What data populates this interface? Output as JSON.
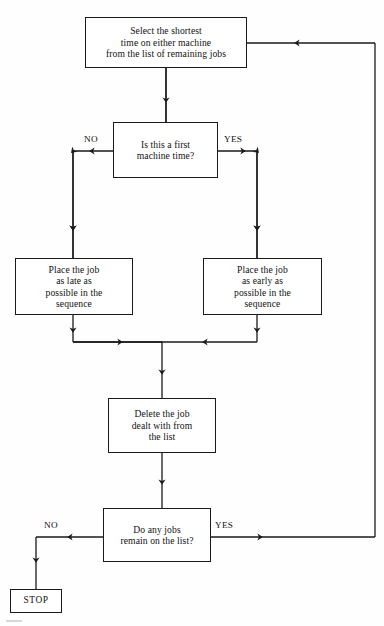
{
  "diagram": {
    "colors": {
      "line": "#1a1a1a",
      "text": "#111111",
      "background": "#fefefe"
    },
    "nodes": {
      "start": {
        "shape": "rectangle",
        "text": "Select the shortest\ntime on either machine\nfrom the list of remaining jobs"
      },
      "first_machine": {
        "shape": "rectangle",
        "text": "Is this a first\nmachine time?"
      },
      "place_late": {
        "shape": "rectangle",
        "text": "Place the job\nas late as\npossible in the\nsequence"
      },
      "place_early": {
        "shape": "rectangle",
        "text": "Place the job\nas early as\npossible in the\nsequence"
      },
      "delete_job": {
        "shape": "rectangle",
        "text": "Delete the job\ndealt with from\nthe list"
      },
      "jobs_remain": {
        "shape": "rectangle",
        "text": "Do any jobs\nremain on the list?"
      },
      "stop": {
        "shape": "rectangle",
        "text": "STOP"
      }
    },
    "edge_labels": {
      "first_machine_no": "NO",
      "first_machine_yes": "YES",
      "jobs_remain_no": "NO",
      "jobs_remain_yes": "YES"
    }
  }
}
